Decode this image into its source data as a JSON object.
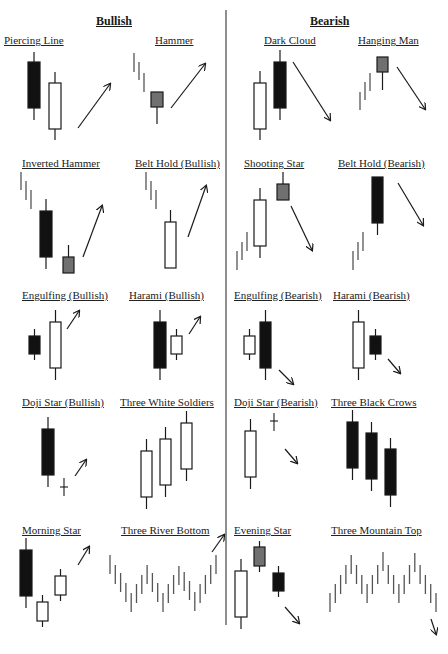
{
  "headers": {
    "bullish": "Bullish",
    "bearish": "Bearish"
  },
  "colors": {
    "ink": "#1a1a1a",
    "dark_candle": "#111111",
    "gray_candle": "#707070",
    "light_candle": "#ffffff",
    "bar_gray": "#555555"
  },
  "patterns": [
    {
      "id": "piercing-line",
      "label": "Piercing Line",
      "group": "bullish",
      "x": 4,
      "y": 34
    },
    {
      "id": "hammer",
      "label": "Hammer",
      "group": "bullish",
      "x": 155,
      "y": 34
    },
    {
      "id": "dark-cloud",
      "label": "Dark Cloud",
      "group": "bearish",
      "x": 264,
      "y": 34
    },
    {
      "id": "hanging-man",
      "label": "Hanging Man",
      "group": "bearish",
      "x": 358,
      "y": 34
    },
    {
      "id": "inverted-hammer",
      "label": "Inverted Hammer",
      "group": "bullish",
      "x": 22,
      "y": 157
    },
    {
      "id": "belt-hold-bullish",
      "label": "Belt Hold (Bullish)",
      "group": "bullish",
      "x": 135,
      "y": 157
    },
    {
      "id": "shooting-star",
      "label": "Shooting Star",
      "group": "bearish",
      "x": 244,
      "y": 157
    },
    {
      "id": "belt-hold-bearish",
      "label": "Belt Hold (Bearish)",
      "group": "bearish",
      "x": 338,
      "y": 157
    },
    {
      "id": "engulfing-bullish",
      "label": "Engulfing (Bullish)",
      "group": "bullish",
      "x": 22,
      "y": 289
    },
    {
      "id": "harami-bullish",
      "label": "Harami (Bullish)",
      "group": "bullish",
      "x": 129,
      "y": 289
    },
    {
      "id": "engulfing-bearish",
      "label": "Engulfing (Bearish)",
      "group": "bearish",
      "x": 234,
      "y": 289
    },
    {
      "id": "harami-bearish",
      "label": "Harami (Bearish)",
      "group": "bearish",
      "x": 333,
      "y": 289
    },
    {
      "id": "doji-star-bullish",
      "label": "Doji Star (Bullish)",
      "group": "bullish",
      "x": 22,
      "y": 396
    },
    {
      "id": "three-white-soldiers",
      "label": "Three White Soldiers",
      "group": "bullish",
      "x": 120,
      "y": 396
    },
    {
      "id": "doji-star-bearish",
      "label": "Doji Star (Bearish)",
      "group": "bearish",
      "x": 234,
      "y": 396
    },
    {
      "id": "three-black-crows",
      "label": "Three Black Crows",
      "group": "bearish",
      "x": 331,
      "y": 396
    },
    {
      "id": "morning-star",
      "label": "Morning Star",
      "group": "bullish",
      "x": 22,
      "y": 524
    },
    {
      "id": "three-river-bottom",
      "label": "Three River Bottom",
      "group": "bullish",
      "x": 121,
      "y": 524
    },
    {
      "id": "evening-star",
      "label": "Evening Star",
      "group": "bearish",
      "x": 234,
      "y": 524
    },
    {
      "id": "three-mountain-top",
      "label": "Three Mountain Top",
      "group": "bearish",
      "x": 331,
      "y": 524
    }
  ],
  "shapes": {
    "candles": [
      {
        "p": "piercing-line",
        "x": 28,
        "w": 12,
        "wt": 52,
        "bt": 62,
        "bb": 108,
        "wb": 120,
        "fill": "dark"
      },
      {
        "p": "piercing-line",
        "x": 49,
        "w": 12,
        "wt": 72,
        "bt": 83,
        "bb": 129,
        "wb": 140,
        "fill": "light"
      },
      {
        "p": "hammer",
        "x": 151,
        "w": 12,
        "wt": 92,
        "bt": 92,
        "bb": 107,
        "wb": 124,
        "fill": "gray"
      },
      {
        "p": "dark-cloud",
        "x": 254,
        "w": 12,
        "wt": 71,
        "bt": 83,
        "bb": 129,
        "wb": 140,
        "fill": "light"
      },
      {
        "p": "dark-cloud",
        "x": 274,
        "w": 12,
        "wt": 50,
        "bt": 62,
        "bb": 108,
        "wb": 120,
        "fill": "dark"
      },
      {
        "p": "hanging-man",
        "x": 377,
        "w": 11,
        "wt": 57,
        "bt": 57,
        "bb": 72,
        "wb": 90,
        "fill": "gray"
      },
      {
        "p": "inverted-hammer",
        "x": 40,
        "w": 12,
        "wt": 199,
        "bt": 211,
        "bb": 257,
        "wb": 269,
        "fill": "dark"
      },
      {
        "p": "inverted-hammer",
        "x": 63,
        "w": 11,
        "wt": 245,
        "bt": 257,
        "bb": 273,
        "wb": 273,
        "fill": "gray"
      },
      {
        "p": "belt-hold-bullish",
        "x": 165,
        "w": 11,
        "wt": 210,
        "bt": 222,
        "bb": 268,
        "wb": 268,
        "fill": "light"
      },
      {
        "p": "shooting-star",
        "x": 254,
        "w": 12,
        "wt": 188,
        "bt": 200,
        "bb": 246,
        "wb": 258,
        "fill": "light"
      },
      {
        "p": "shooting-star",
        "x": 277,
        "w": 12,
        "wt": 172,
        "bt": 184,
        "bb": 200,
        "wb": 200,
        "fill": "gray"
      },
      {
        "p": "belt-hold-bearish",
        "x": 372,
        "w": 11,
        "wt": 177,
        "bt": 177,
        "bb": 223,
        "wb": 235,
        "fill": "dark"
      },
      {
        "p": "engulfing-bullish",
        "x": 29,
        "w": 11,
        "wt": 329,
        "bt": 336,
        "bb": 354,
        "wb": 360,
        "fill": "dark"
      },
      {
        "p": "engulfing-bullish",
        "x": 50,
        "w": 11,
        "wt": 310,
        "bt": 322,
        "bb": 368,
        "wb": 380,
        "fill": "light"
      },
      {
        "p": "harami-bullish",
        "x": 154,
        "w": 12,
        "wt": 310,
        "bt": 322,
        "bb": 368,
        "wb": 380,
        "fill": "dark"
      },
      {
        "p": "harami-bullish",
        "x": 171,
        "w": 11,
        "wt": 329,
        "bt": 336,
        "bb": 354,
        "wb": 360,
        "fill": "light"
      },
      {
        "p": "engulfing-bearish",
        "x": 244,
        "w": 11,
        "wt": 329,
        "bt": 336,
        "bb": 354,
        "wb": 360,
        "fill": "light"
      },
      {
        "p": "engulfing-bearish",
        "x": 260,
        "w": 11,
        "wt": 310,
        "bt": 322,
        "bb": 368,
        "wb": 380,
        "fill": "dark"
      },
      {
        "p": "harami-bearish",
        "x": 353,
        "w": 11,
        "wt": 310,
        "bt": 322,
        "bb": 368,
        "wb": 380,
        "fill": "light"
      },
      {
        "p": "harami-bearish",
        "x": 370,
        "w": 11,
        "wt": 329,
        "bt": 336,
        "bb": 354,
        "wb": 360,
        "fill": "dark"
      },
      {
        "p": "doji-star-bullish",
        "x": 42,
        "w": 12,
        "wt": 417,
        "bt": 429,
        "bb": 475,
        "wb": 487,
        "fill": "dark"
      },
      {
        "p": "three-white-soldiers",
        "x": 141,
        "w": 11,
        "wt": 439,
        "bt": 451,
        "bb": 497,
        "wb": 509,
        "fill": "light"
      },
      {
        "p": "three-white-soldiers",
        "x": 160,
        "w": 11,
        "wt": 427,
        "bt": 439,
        "bb": 485,
        "wb": 497,
        "fill": "light"
      },
      {
        "p": "three-white-soldiers",
        "x": 181,
        "w": 11,
        "wt": 411,
        "bt": 423,
        "bb": 469,
        "wb": 481,
        "fill": "light"
      },
      {
        "p": "doji-star-bearish",
        "x": 245,
        "w": 11,
        "wt": 419,
        "bt": 431,
        "bb": 477,
        "wb": 489,
        "fill": "light"
      },
      {
        "p": "three-black-crows",
        "x": 347,
        "w": 11,
        "wt": 410,
        "bt": 422,
        "bb": 468,
        "wb": 480,
        "fill": "dark"
      },
      {
        "p": "three-black-crows",
        "x": 366,
        "w": 11,
        "wt": 422,
        "bt": 433,
        "bb": 479,
        "wb": 491,
        "fill": "dark"
      },
      {
        "p": "three-black-crows",
        "x": 385,
        "w": 11,
        "wt": 438,
        "bt": 449,
        "bb": 495,
        "wb": 507,
        "fill": "dark"
      },
      {
        "p": "morning-star",
        "x": 20,
        "w": 12,
        "wt": 538,
        "bt": 550,
        "bb": 596,
        "wb": 608,
        "fill": "dark"
      },
      {
        "p": "morning-star",
        "x": 37,
        "w": 11,
        "wt": 595,
        "bt": 602,
        "bb": 621,
        "wb": 627,
        "fill": "light"
      },
      {
        "p": "morning-star",
        "x": 55,
        "w": 11,
        "wt": 569,
        "bt": 576,
        "bb": 595,
        "wb": 601,
        "fill": "light"
      },
      {
        "p": "evening-star",
        "x": 235,
        "w": 12,
        "wt": 559,
        "bt": 571,
        "bb": 617,
        "wb": 629,
        "fill": "light"
      },
      {
        "p": "evening-star",
        "x": 254,
        "w": 11,
        "wt": 541,
        "bt": 547,
        "bb": 566,
        "wb": 572,
        "fill": "gray"
      },
      {
        "p": "evening-star",
        "x": 273,
        "w": 11,
        "wt": 566,
        "bt": 573,
        "bb": 591,
        "wb": 597,
        "fill": "dark"
      }
    ],
    "dojis": [
      {
        "p": "doji-star-bullish",
        "x": 64,
        "t": 478,
        "b": 496,
        "m": 487
      },
      {
        "p": "doji-star-bearish",
        "x": 274,
        "t": 413,
        "b": 431,
        "m": 421
      }
    ],
    "bars": [
      {
        "p": "hammer",
        "x": 134,
        "t": 53,
        "b": 72
      },
      {
        "p": "hammer",
        "x": 139,
        "t": 62,
        "b": 80
      },
      {
        "p": "hammer",
        "x": 144,
        "t": 73,
        "b": 92
      },
      {
        "p": "hanging-man",
        "x": 360,
        "t": 92,
        "b": 110
      },
      {
        "p": "hanging-man",
        "x": 365,
        "t": 82,
        "b": 100
      },
      {
        "p": "hanging-man",
        "x": 370,
        "t": 73,
        "b": 91
      },
      {
        "p": "inverted-hammer",
        "x": 21,
        "t": 172,
        "b": 190
      },
      {
        "p": "inverted-hammer",
        "x": 26,
        "t": 181,
        "b": 200
      },
      {
        "p": "inverted-hammer",
        "x": 31,
        "t": 190,
        "b": 209
      },
      {
        "p": "belt-hold-bullish",
        "x": 146,
        "t": 172,
        "b": 190
      },
      {
        "p": "belt-hold-bullish",
        "x": 151,
        "t": 181,
        "b": 200
      },
      {
        "p": "belt-hold-bullish",
        "x": 156,
        "t": 190,
        "b": 209
      },
      {
        "p": "shooting-star",
        "x": 237,
        "t": 251,
        "b": 270
      },
      {
        "p": "shooting-star",
        "x": 242,
        "t": 242,
        "b": 260
      },
      {
        "p": "shooting-star",
        "x": 247,
        "t": 232,
        "b": 251
      },
      {
        "p": "belt-hold-bearish",
        "x": 353,
        "t": 251,
        "b": 270
      },
      {
        "p": "belt-hold-bearish",
        "x": 358,
        "t": 242,
        "b": 260
      },
      {
        "p": "belt-hold-bearish",
        "x": 363,
        "t": 232,
        "b": 251
      }
    ],
    "zigzags": [
      {
        "p": "three-river-bottom",
        "x0": 110,
        "dx": 5.3,
        "h": 19,
        "tops": [
          555,
          565,
          573,
          583,
          593,
          584,
          575,
          565,
          573,
          583,
          593,
          584,
          575,
          566,
          572,
          581,
          592,
          584,
          575,
          565,
          555
        ]
      },
      {
        "p": "three-mountain-top",
        "x0": 330,
        "dx": 5.3,
        "h": 19,
        "tops": [
          593,
          584,
          575,
          565,
          555,
          565,
          575,
          584,
          575,
          565,
          552,
          565,
          575,
          584,
          575,
          565,
          553,
          565,
          575,
          584,
          593
        ]
      }
    ],
    "arrows": [
      {
        "p": "piercing-line",
        "x1": 78,
        "y1": 128,
        "x2": 110,
        "y2": 84
      },
      {
        "p": "hammer",
        "x1": 171,
        "y1": 108,
        "x2": 205,
        "y2": 64
      },
      {
        "p": "dark-cloud",
        "x1": 293,
        "y1": 62,
        "x2": 330,
        "y2": 120
      },
      {
        "p": "hanging-man",
        "x1": 397,
        "y1": 67,
        "x2": 425,
        "y2": 109
      },
      {
        "p": "inverted-hammer",
        "x1": 83,
        "y1": 257,
        "x2": 102,
        "y2": 206
      },
      {
        "p": "belt-hold-bullish",
        "x1": 188,
        "y1": 237,
        "x2": 206,
        "y2": 186
      },
      {
        "p": "shooting-star",
        "x1": 291,
        "y1": 206,
        "x2": 312,
        "y2": 250
      },
      {
        "p": "belt-hold-bearish",
        "x1": 398,
        "y1": 183,
        "x2": 423,
        "y2": 225
      },
      {
        "p": "engulfing-bullish",
        "x1": 67,
        "y1": 329,
        "x2": 79,
        "y2": 311
      },
      {
        "p": "harami-bullish",
        "x1": 189,
        "y1": 334,
        "x2": 200,
        "y2": 317
      },
      {
        "p": "engulfing-bearish",
        "x1": 279,
        "y1": 370,
        "x2": 293,
        "y2": 384
      },
      {
        "p": "harami-bearish",
        "x1": 388,
        "y1": 359,
        "x2": 400,
        "y2": 373
      },
      {
        "p": "doji-star-bullish",
        "x1": 75,
        "y1": 476,
        "x2": 86,
        "y2": 460
      },
      {
        "p": "doji-star-bearish",
        "x1": 285,
        "y1": 449,
        "x2": 297,
        "y2": 463
      },
      {
        "p": "morning-star",
        "x1": 78,
        "y1": 565,
        "x2": 89,
        "y2": 547
      },
      {
        "p": "three-river-bottom",
        "x1": 212,
        "y1": 552,
        "x2": 224,
        "y2": 535
      },
      {
        "p": "evening-star",
        "x1": 285,
        "y1": 607,
        "x2": 299,
        "y2": 623
      },
      {
        "p": "three-mountain-top",
        "x1": 431,
        "y1": 619,
        "x2": 436,
        "y2": 634
      }
    ],
    "divider": {
      "x": 226,
      "y1": 10,
      "y2": 625
    }
  }
}
